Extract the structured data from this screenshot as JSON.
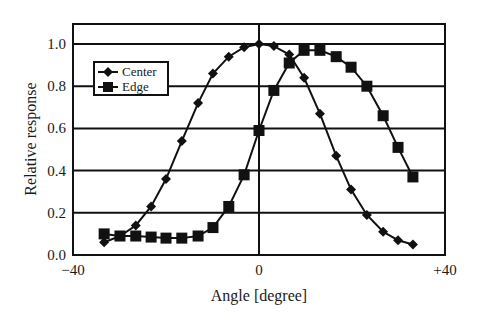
{
  "chart_data": {
    "type": "line",
    "title": "",
    "xlabel": "Angle [degree]",
    "ylabel": "Relative response",
    "xlim": [
      -40,
      40
    ],
    "ylim": [
      0.0,
      1.1
    ],
    "x_ticks": [
      "-40",
      "0",
      "+40"
    ],
    "x_tick_values": [
      -40,
      0,
      40
    ],
    "y_ticks": [
      "0.0",
      "0.2",
      "0.4",
      "0.6",
      "0.8",
      "1.0"
    ],
    "y_tick_values": [
      0.0,
      0.2,
      0.4,
      0.6,
      0.8,
      1.0
    ],
    "grid": {
      "horizontal": true,
      "vertical_at_zero": true
    },
    "legend_position": "upper-left",
    "x": [
      -33.3,
      -29.9,
      -26.5,
      -23.2,
      -20.0,
      -16.6,
      -13.1,
      -9.9,
      -6.5,
      -3.2,
      0.0,
      3.2,
      6.5,
      9.7,
      13.1,
      16.6,
      19.8,
      23.2,
      26.7,
      29.9,
      33.1
    ],
    "series": [
      {
        "name": "Center",
        "marker": "diamond",
        "values": [
          0.06,
          0.09,
          0.14,
          0.23,
          0.36,
          0.54,
          0.72,
          0.86,
          0.94,
          0.985,
          1.0,
          0.99,
          0.95,
          0.84,
          0.67,
          0.47,
          0.31,
          0.19,
          0.11,
          0.07,
          0.05
        ]
      },
      {
        "name": "Edge",
        "marker": "square",
        "values": [
          0.1,
          0.09,
          0.09,
          0.085,
          0.08,
          0.08,
          0.09,
          0.13,
          0.23,
          0.38,
          0.59,
          0.78,
          0.91,
          0.97,
          0.97,
          0.94,
          0.89,
          0.8,
          0.66,
          0.51,
          0.37
        ]
      }
    ]
  },
  "colors": {
    "line": "#111111",
    "grid": "#111111",
    "background": "#ffffff"
  }
}
